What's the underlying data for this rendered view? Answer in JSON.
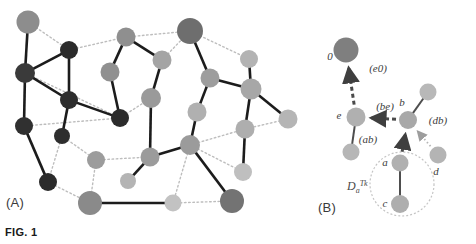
{
  "figure": {
    "caption": "FIG. 1",
    "panel_a_label": "(A)",
    "panel_b_label": "(B)"
  },
  "panel_a": {
    "name": "network-graph",
    "description": "Undirected network of shaded circular nodes connected by solid dark edges and light dotted edges",
    "node_count": 30,
    "colors": {
      "node_dark": "#2b2b2b",
      "node_mid_dark": "#6e6e6e",
      "node_mid": "#9a9a9a",
      "node_light": "#b8b8b8",
      "node_pale": "#c9c9c9",
      "edge_solid": "#1c1c1c",
      "edge_dotted": "#bdbdbd"
    },
    "nodes": [
      {
        "id": "a1",
        "x": 28,
        "y": 22,
        "r": 11.5,
        "shade": "#8d8d8d"
      },
      {
        "id": "a2",
        "x": 69,
        "y": 50,
        "r": 9.0,
        "shade": "#2b2b2b"
      },
      {
        "id": "a3",
        "x": 25,
        "y": 73,
        "r": 10.0,
        "shade": "#3a3a3a"
      },
      {
        "id": "a4",
        "x": 69,
        "y": 100,
        "r": 9.0,
        "shade": "#2d2d2d"
      },
      {
        "id": "a5",
        "x": 24,
        "y": 126,
        "r": 9.0,
        "shade": "#303030"
      },
      {
        "id": "a6",
        "x": 62,
        "y": 136,
        "r": 8.0,
        "shade": "#2e2e2e"
      },
      {
        "id": "a7",
        "x": 48,
        "y": 182,
        "r": 9.0,
        "shade": "#2b2b2b"
      },
      {
        "id": "a8",
        "x": 90,
        "y": 203,
        "r": 12.0,
        "shade": "#8a8a8a"
      },
      {
        "id": "a9",
        "x": 120,
        "y": 118,
        "r": 9.0,
        "shade": "#2c2c2c"
      },
      {
        "id": "a10",
        "x": 96,
        "y": 160,
        "r": 9.0,
        "shade": "#9c9c9c"
      },
      {
        "id": "a11",
        "x": 110,
        "y": 72,
        "r": 9.5,
        "shade": "#909090"
      },
      {
        "id": "a12",
        "x": 126,
        "y": 37,
        "r": 9.5,
        "shade": "#8f8f8f"
      },
      {
        "id": "a13",
        "x": 151,
        "y": 98,
        "r": 10.0,
        "shade": "#9a9a9a"
      },
      {
        "id": "a14",
        "x": 162,
        "y": 60,
        "r": 9.5,
        "shade": "#a4a4a4"
      },
      {
        "id": "a15",
        "x": 128,
        "y": 181,
        "r": 8.0,
        "shade": "#b4b4b4"
      },
      {
        "id": "a16",
        "x": 150,
        "y": 157,
        "r": 9.5,
        "shade": "#9b9b9b"
      },
      {
        "id": "a17",
        "x": 190,
        "y": 31,
        "r": 13.0,
        "shade": "#6e6e6e"
      },
      {
        "id": "a18",
        "x": 210,
        "y": 78,
        "r": 9.5,
        "shade": "#9d9d9d"
      },
      {
        "id": "a19",
        "x": 197,
        "y": 112,
        "r": 9.5,
        "shade": "#b0b0b0"
      },
      {
        "id": "a20",
        "x": 190,
        "y": 145,
        "r": 10.0,
        "shade": "#9b9b9b"
      },
      {
        "id": "a21",
        "x": 173,
        "y": 203,
        "r": 8.5,
        "shade": "#c2c2c2"
      },
      {
        "id": "a22",
        "x": 232,
        "y": 201,
        "r": 12.0,
        "shade": "#737373"
      },
      {
        "id": "a23",
        "x": 249,
        "y": 59,
        "r": 9.0,
        "shade": "#b3b3b3"
      },
      {
        "id": "a24",
        "x": 251,
        "y": 89,
        "r": 10.5,
        "shade": "#a7a7a7"
      },
      {
        "id": "a25",
        "x": 288,
        "y": 119,
        "r": 9.5,
        "shade": "#b5b5b5"
      },
      {
        "id": "a26",
        "x": 245,
        "y": 129,
        "r": 9.5,
        "shade": "#aeaeae"
      },
      {
        "id": "a27",
        "x": 243,
        "y": 172,
        "r": 9.0,
        "shade": "#bfbfbf"
      }
    ],
    "solid_edges": [
      [
        "a1",
        "a3"
      ],
      [
        "a2",
        "a3"
      ],
      [
        "a3",
        "a4"
      ],
      [
        "a3",
        "a5"
      ],
      [
        "a4",
        "a9"
      ],
      [
        "a4",
        "a6"
      ],
      [
        "a5",
        "a7"
      ],
      [
        "a9",
        "a11"
      ],
      [
        "a11",
        "a12"
      ],
      [
        "a12",
        "a14"
      ],
      [
        "a13",
        "a14"
      ],
      [
        "a13",
        "a16"
      ],
      [
        "a16",
        "a15"
      ],
      [
        "a16",
        "a20"
      ],
      [
        "a8",
        "a21"
      ],
      [
        "a17",
        "a18"
      ],
      [
        "a18",
        "a24"
      ],
      [
        "a18",
        "a19"
      ],
      [
        "a19",
        "a20"
      ],
      [
        "a20",
        "a22"
      ],
      [
        "a23",
        "a24"
      ],
      [
        "a24",
        "a25"
      ],
      [
        "a24",
        "a26"
      ],
      [
        "a26",
        "a27"
      ],
      [
        "a2",
        "a4"
      ]
    ],
    "dotted_edges": [
      [
        "a1",
        "a2"
      ],
      [
        "a2",
        "a12"
      ],
      [
        "a3",
        "a9"
      ],
      [
        "a5",
        "a9"
      ],
      [
        "a6",
        "a10"
      ],
      [
        "a7",
        "a8"
      ],
      [
        "a6",
        "a7"
      ],
      [
        "a9",
        "a13"
      ],
      [
        "a11",
        "a12"
      ],
      [
        "a10",
        "a16"
      ],
      [
        "a12",
        "a17"
      ],
      [
        "a17",
        "a23"
      ],
      [
        "a14",
        "a17"
      ],
      [
        "a18",
        "a19"
      ],
      [
        "a19",
        "a20"
      ],
      [
        "a20",
        "a26"
      ],
      [
        "a20",
        "a21"
      ],
      [
        "a21",
        "a22"
      ],
      [
        "a25",
        "a26"
      ],
      [
        "a26",
        "a27"
      ],
      [
        "a20",
        "a27"
      ],
      [
        "a8",
        "a10"
      ]
    ]
  },
  "panel_b": {
    "name": "routing-detail",
    "description": "Detail view showing directed distance-vector messages between labelled nodes",
    "colors": {
      "node_dark": "#8d8d8d",
      "node_mid": "#a9a9a9",
      "node_light": "#bcbcbc",
      "arrow_dashed": "#4a4a4a",
      "arrow_dotted": "#b4b4b4",
      "edge_solid": "#4e4e4e",
      "set_circle": "#c4c4c4"
    },
    "nodes": [
      {
        "id": "n0",
        "label": "0",
        "x": 346,
        "y": 50,
        "r": 12.5,
        "shade": "#7f7f7f",
        "label_dx": -16,
        "label_dy": 10
      },
      {
        "id": "ne",
        "label": "e",
        "x": 356,
        "y": 117,
        "r": 9.5,
        "shade": "#b0b0b0",
        "label_dx": -17,
        "label_dy": 2
      },
      {
        "id": "ne2",
        "label": "",
        "x": 351,
        "y": 152,
        "r": 8.5,
        "shade": "#b6b6b6",
        "label_dx": 0,
        "label_dy": 0
      },
      {
        "id": "nb",
        "label": "b",
        "x": 408,
        "y": 120,
        "r": 9.0,
        "shade": "#a8a8a8",
        "label_dx": -6,
        "label_dy": -14
      },
      {
        "id": "nb2",
        "label": "",
        "x": 428,
        "y": 92,
        "r": 8.5,
        "shade": "#b8b8b8",
        "label_dx": 0,
        "label_dy": 0
      },
      {
        "id": "nd",
        "label": "d",
        "x": 438,
        "y": 155,
        "r": 8.5,
        "shade": "#b4b4b4",
        "label_dx": -2,
        "label_dy": 20
      },
      {
        "id": "na",
        "label": "a",
        "x": 400,
        "y": 163,
        "r": 8.5,
        "shade": "#b0b0b0",
        "label_dx": -15,
        "label_dy": 3
      },
      {
        "id": "nc",
        "label": "c",
        "x": 400,
        "y": 204,
        "r": 9.0,
        "shade": "#aeaeae",
        "label_dx": -15,
        "label_dy": 3
      }
    ],
    "solid_edges": [
      [
        "ne",
        "ne2"
      ],
      [
        "nb",
        "nb2"
      ],
      [
        "na",
        "nc"
      ]
    ],
    "dashed_arrows": [
      {
        "id": "arrow-e0",
        "from": "ne",
        "to": "n0",
        "label": "(e0)",
        "label_x": 378,
        "label_y": 72
      },
      {
        "id": "arrow-be",
        "from": "nb",
        "to": "ne",
        "label": "(be)",
        "label_x": 385,
        "label_y": 110
      },
      {
        "id": "arrow-ab",
        "from": "na",
        "to": "nb",
        "label": "(ab)",
        "label_x": 368,
        "label_y": 143
      }
    ],
    "dotted_arrows": [
      {
        "id": "arrow-db",
        "from": "nd",
        "to": "nb",
        "label": "(db)",
        "label_x": 438,
        "label_y": 124
      }
    ],
    "set_circle": {
      "cx": 402,
      "cy": 184,
      "r": 32,
      "label_main": "D",
      "label_sub": "a",
      "label_sup": "Tk",
      "label_x": 347,
      "label_y": 190
    }
  }
}
